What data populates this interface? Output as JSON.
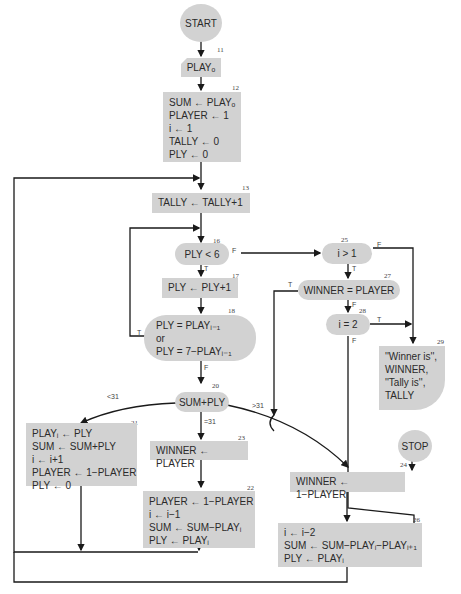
{
  "nodes": {
    "start": {
      "label": "START"
    },
    "n11": {
      "num": "11",
      "label": "PLAYₒ"
    },
    "n12": {
      "num": "12",
      "lines": [
        "SUM ← PLAYₒ",
        "PLAYER ← 1",
        "i ← 1",
        "TALLY ← 0",
        "PLY ← 0"
      ]
    },
    "n13": {
      "num": "13",
      "label": "TALLY ← TALLY+1"
    },
    "n16": {
      "num": "16",
      "label": "PLY < 6"
    },
    "n17": {
      "num": "17",
      "label": "PLY ← PLY+1"
    },
    "n18": {
      "num": "18",
      "lines": [
        "PLY = PLAYᵢ₋₁",
        "or",
        "PLY = 7−PLAYᵢ₋₁"
      ]
    },
    "n20": {
      "num": "20",
      "label": "SUM+PLY"
    },
    "n21": {
      "num": "21",
      "lines": [
        "PLAYᵢ ← PLY",
        "SUM ← SUM+PLY",
        "i ← i+1",
        "PLAYER ← 1−PLAYER",
        "PLY ← 0"
      ]
    },
    "n22": {
      "num": "22",
      "lines": [
        "PLAYER ← 1−PLAYER",
        "i ← i−1",
        "SUM ← SUM−PLAYᵢ",
        "PLY ← PLAYᵢ"
      ]
    },
    "n23": {
      "num": "23",
      "label": "WINNER ← PLAYER"
    },
    "n24": {
      "num": "24",
      "label": "WINNER ← 1−PLAYER"
    },
    "n25": {
      "num": "25",
      "label": "i > 1"
    },
    "n26": {
      "num": "26",
      "lines": [
        "i ← i−2",
        "SUM ← SUM−PLAYᵢ−PLAYᵢ₊₁",
        "PLY ← PLAYᵢ"
      ]
    },
    "n27": {
      "num": "27",
      "label": "WINNER = PLAYER"
    },
    "n28": {
      "num": "28",
      "label": "i = 2"
    },
    "n29": {
      "num": "29",
      "lines": [
        "''Winner is'',",
        "WINNER,",
        "''Tally is'',",
        "TALLY"
      ]
    },
    "stop": {
      "label": "STOP"
    }
  },
  "edges": {
    "t": "T",
    "f": "F",
    "lt31": "<31",
    "eq31": "=31",
    "gt31": ">31"
  },
  "colors": {
    "node_fill": "#d2d2d2",
    "line": "#1a1a1a",
    "text": "#2a2a2a"
  }
}
